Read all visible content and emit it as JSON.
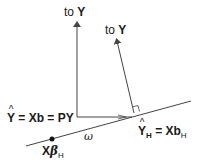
{
  "diagram": {
    "type": "geometric-projection",
    "labels": {
      "arrow1": {
        "prefix": "to ",
        "target": "Y"
      },
      "arrow2": {
        "prefix": "to ",
        "target": "Y"
      },
      "yhat": {
        "hat_symbol": "Y",
        "eq1": " = Xb = PY"
      },
      "yhat_h": {
        "hat_symbol": "Y",
        "sub": "H",
        "eq": " = Xb",
        "eq_sub": "H"
      },
      "xbeta": {
        "x": "X",
        "beta": "β",
        "sub": "H"
      },
      "omega": "ω"
    },
    "colors": {
      "line": "#444444",
      "text": "#1a1a1a"
    }
  }
}
